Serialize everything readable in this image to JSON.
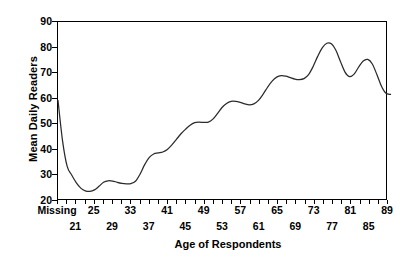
{
  "chart_data": {
    "type": "line",
    "title": "",
    "xlabel": "Age of Respondents",
    "ylabel": "Mean Daily Readers",
    "ylim": [
      20,
      90
    ],
    "yticks": [
      20,
      30,
      40,
      50,
      60,
      70,
      80,
      90
    ],
    "grid": false,
    "legend": null,
    "x_categories": [
      "Missing",
      "18",
      "19",
      "20",
      "21",
      "22",
      "23",
      "24",
      "25",
      "26",
      "27",
      "28",
      "29",
      "30",
      "31",
      "32",
      "33",
      "34",
      "35",
      "36",
      "37",
      "38",
      "39",
      "40",
      "41",
      "42",
      "43",
      "44",
      "45",
      "46",
      "47",
      "48",
      "49",
      "50",
      "51",
      "52",
      "53",
      "54",
      "55",
      "56",
      "57",
      "58",
      "59",
      "60",
      "61",
      "62",
      "63",
      "64",
      "65",
      "66",
      "67",
      "68",
      "69",
      "70",
      "71",
      "72",
      "73",
      "74",
      "75",
      "76",
      "77",
      "78",
      "79",
      "80",
      "81",
      "82",
      "83",
      "84",
      "85",
      "86",
      "87",
      "88",
      "89"
    ],
    "x_tick_labels_row1": [
      "Missing",
      "25",
      "33",
      "41",
      "49",
      "57",
      "65",
      "73",
      "81",
      "89"
    ],
    "x_tick_labels_row2": [
      "21",
      "29",
      "37",
      "45",
      "53",
      "61",
      "69",
      "77",
      "85"
    ],
    "series": [
      {
        "name": "Mean Daily Readers",
        "color": "#2b2b2b",
        "values": [
          59.0,
          43.0,
          33.0,
          29.5,
          26.5,
          24.3,
          23.2,
          23.0,
          23.6,
          25.0,
          26.6,
          27.2,
          27.1,
          26.6,
          26.2,
          26.0,
          26.1,
          27.0,
          29.8,
          33.5,
          36.4,
          37.8,
          38.2,
          38.6,
          39.6,
          41.4,
          43.6,
          45.8,
          47.6,
          49.2,
          50.2,
          50.4,
          50.3,
          50.4,
          51.6,
          53.8,
          56.2,
          57.8,
          58.6,
          58.6,
          58.2,
          57.6,
          57.2,
          57.6,
          59.0,
          61.4,
          64.2,
          66.6,
          68.2,
          68.8,
          68.6,
          68.0,
          67.4,
          67.2,
          67.6,
          69.2,
          72.4,
          76.4,
          79.8,
          81.6,
          81.4,
          78.8,
          74.4,
          70.2,
          68.4,
          69.4,
          72.2,
          74.6,
          75.2,
          73.4,
          69.2,
          64.6,
          61.8,
          61.4
        ]
      }
    ]
  },
  "axes": {
    "y_tick_values": [
      "90",
      "80",
      "70",
      "60",
      "50",
      "40",
      "30",
      "20"
    ],
    "y_title": "Mean Daily Readers",
    "x_title": "Age of Respondents"
  },
  "colors": {
    "line": "#2b2b2b",
    "axis": "#000000",
    "background": "#ffffff"
  }
}
